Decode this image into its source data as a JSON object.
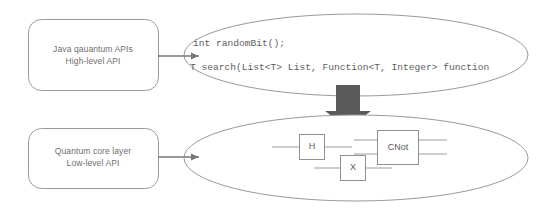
{
  "diagram": {
    "colors": {
      "outline": "#9a9a9a",
      "text": "#6e6e6e",
      "code_text": "#5d5d5d",
      "arrow_block": "#595959",
      "arrow_thin": "#777777",
      "background": "#ffffff",
      "gate_outline": "#8f8f8f",
      "wire": "#9d9d9d"
    },
    "layers": [
      {
        "id": "high-level",
        "box_lines": [
          "Java qauantum APIs",
          "High-level API"
        ],
        "ellipse_content_type": "code",
        "code_lines": [
          "int randomBit();",
          "T search(List<T> List, Function<T, Integer> function"
        ]
      },
      {
        "id": "low-level",
        "box_lines": [
          "Quantum core layer",
          "Low-level API"
        ],
        "ellipse_content_type": "circuit",
        "gates": [
          {
            "id": "gate-h",
            "label": "H"
          },
          {
            "id": "gate-x",
            "label": "X"
          },
          {
            "id": "gate-cnot",
            "label": "CNot"
          }
        ]
      }
    ],
    "connectors": [
      {
        "id": "high-level-box-to-ellipse",
        "kind": "thin-arrow",
        "direction": "right"
      },
      {
        "id": "low-level-box-to-ellipse",
        "kind": "thin-arrow",
        "direction": "right"
      },
      {
        "id": "high-to-low-layer",
        "kind": "block-arrow",
        "direction": "down"
      }
    ]
  }
}
